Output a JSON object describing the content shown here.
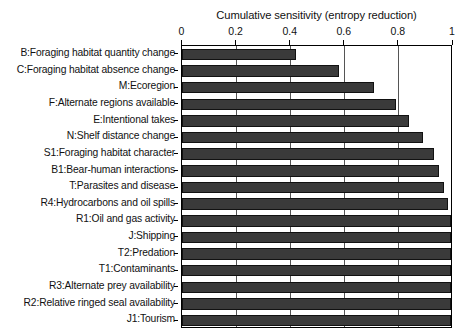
{
  "chart_data": {
    "type": "bar",
    "orientation": "horizontal",
    "title": "Cumulative sensitivity (entropy reduction)",
    "xlabel": "",
    "ylabel": "",
    "xlim": [
      0,
      1
    ],
    "ylim": null,
    "grid": true,
    "legend": null,
    "xticks": [
      "0",
      "0.2",
      "0.4",
      "0.6",
      "0.8",
      "1"
    ],
    "xtick_values": [
      0,
      0.2,
      0.4,
      0.6,
      0.8,
      1
    ],
    "categories": [
      "B:Foraging habitat quantity change",
      "C:Foraging habitat absence change",
      "M:Ecoregion",
      "F:Alternate regions available",
      "E:Intentional takes",
      "N:Shelf distance change",
      "S1:Foraging habitat character",
      "B1:Bear-human interactions",
      "T:Parasites and disease",
      "R4:Hydrocarbons and oil spills",
      "R1:Oil and gas activity",
      "J:Shipping",
      "T2:Predation",
      "T1:Contaminants",
      "R3:Alternate prey availability",
      "R2:Relative ringed seal availability",
      "J1:Tourism"
    ],
    "values": [
      0.42,
      0.58,
      0.71,
      0.79,
      0.84,
      0.89,
      0.93,
      0.95,
      0.97,
      0.985,
      0.995,
      1.0,
      1.0,
      1.0,
      1.0,
      1.0,
      1.0
    ],
    "bar_color": "#3a3a3a",
    "bar_edge_color": "#111111",
    "gridline_color": "#555555",
    "axis_color": "#000000"
  }
}
